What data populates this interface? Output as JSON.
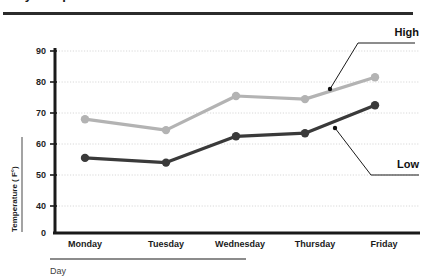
{
  "header": {
    "title": "Daily Temperatures",
    "title_visible_fragment": ""
  },
  "chart_data": {
    "type": "line",
    "title": "",
    "xlabel": "Day",
    "ylabel": "Temperature ( F°)",
    "categories": [
      "Monday",
      "Tuesday",
      "Wednesday",
      "Thursday",
      "Friday"
    ],
    "series": [
      {
        "name": "High",
        "color": "#b3b3b3",
        "values": [
          68,
          64.5,
          75.5,
          74.5,
          81.5
        ]
      },
      {
        "name": "Low",
        "color": "#3a3a3a",
        "values": [
          55.5,
          54,
          62.5,
          63.5,
          72.5
        ]
      }
    ],
    "ylim": [
      0,
      90
    ],
    "yticks": [
      0,
      40,
      50,
      60,
      70,
      80,
      90
    ],
    "ytick_labels": [
      "0",
      "40",
      "50",
      "60",
      "70",
      "80",
      "90"
    ],
    "y_axis_break": true,
    "grid": true,
    "grid_style": "dotted",
    "grid_color": "#d8d8d8",
    "legend_position": "annotations",
    "annotations": [
      {
        "label": "High",
        "target_series": "High",
        "x": 3.7,
        "y": 78.2
      },
      {
        "label": "Low",
        "target_series": "Low",
        "x": 4.15,
        "y": 66.5
      }
    ]
  },
  "axis_labels": {
    "y_tick_90": "90",
    "y_tick_80": "80",
    "y_tick_70": "70",
    "y_tick_60": "60",
    "y_tick_50": "50",
    "y_tick_40": "40",
    "y_tick_0": "0",
    "x_day_0": "Monday",
    "x_day_1": "Tuesday",
    "x_day_2": "Wednesday",
    "x_day_3": "Thursday",
    "x_day_4": "Friday"
  },
  "annotations": {
    "high_label": "High",
    "low_label": "Low"
  },
  "axis_titles": {
    "x": "Day",
    "y": "Temperature ( F°)"
  },
  "colors": {
    "high_line": "#b3b3b3",
    "low_line": "#3a3a3a",
    "axis": "#1a1a1a",
    "grid": "#d8d8d8",
    "accent_bar": "#8c8c8c",
    "title_rule": "#2b2b2b"
  }
}
